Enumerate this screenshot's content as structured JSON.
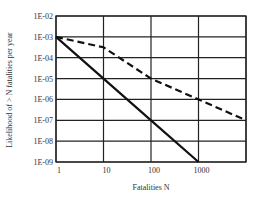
{
  "chart_data": {
    "type": "line",
    "title": "",
    "xlabel": "Fatalities  N",
    "ylabel": "Likelihood of > N fatalities per year",
    "xscale": "log",
    "yscale": "log",
    "xlim": [
      1,
      10000
    ],
    "ylim": [
      1e-09,
      0.01
    ],
    "x_ticks": [
      "1",
      "10",
      "100",
      "1000"
    ],
    "y_ticks": [
      "1E-02",
      "1E-03",
      "1E-04",
      "1E-05",
      "1E-06",
      "1E-07",
      "1E-08",
      "1E-09"
    ],
    "grid": true,
    "legend": null,
    "series": [
      {
        "name": "solid line",
        "style": "solid",
        "x": [
          1,
          10,
          100,
          1000
        ],
        "y": [
          0.001,
          1e-05,
          1e-07,
          1e-09
        ]
      },
      {
        "name": "dashed line",
        "style": "dashed",
        "x": [
          1,
          10,
          100,
          1000,
          10000
        ],
        "y": [
          0.001,
          0.000316,
          1e-05,
          1e-06,
          1e-07
        ]
      }
    ]
  },
  "labels": {
    "xlabel": "Fatalities  N",
    "ylabel": "Likelihood of > N fatalities per year"
  }
}
